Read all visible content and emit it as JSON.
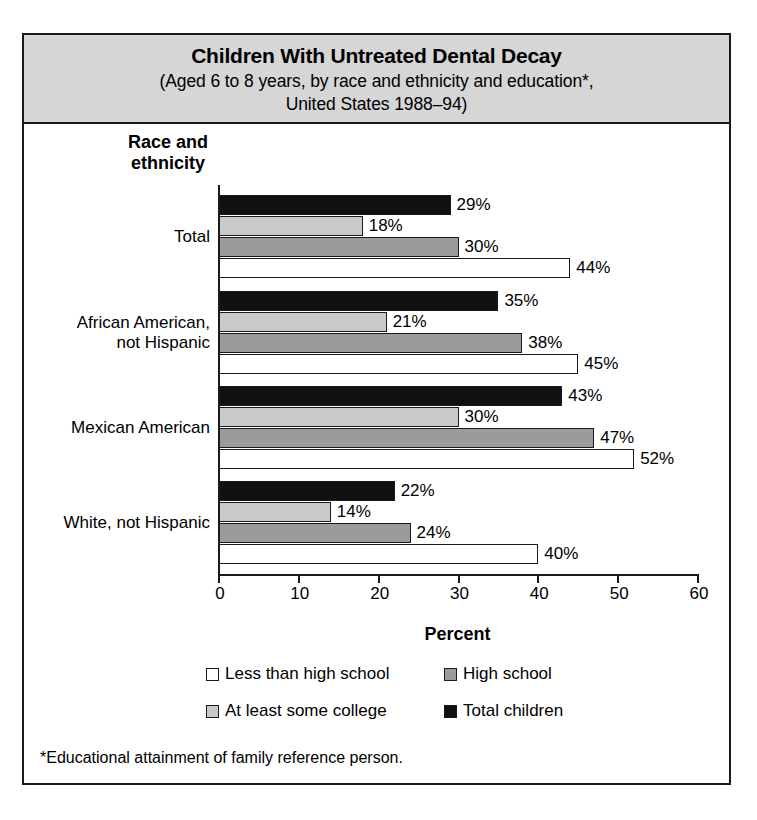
{
  "figure": {
    "title_main": "Children With Untreated Dental Decay",
    "title_sub_line1": "(Aged 6 to 8 years, by race and ethnicity and education*,",
    "title_sub_line2": "United States 1988–94)",
    "footnote": "*Educational attainment of family reference person."
  },
  "axes": {
    "y_title_line1": "Race and",
    "y_title_line2": "ethnicity",
    "x_title": "Percent"
  },
  "legend": {
    "items": [
      {
        "label": "Less than high school",
        "key": "lths",
        "color": "#ffffff"
      },
      {
        "label": "High school",
        "key": "hs",
        "color": "#9b9b9b"
      },
      {
        "label": "At least some college",
        "key": "col",
        "color": "#c9c9c9"
      },
      {
        "label": "Total children",
        "key": "total",
        "color": "#111111"
      }
    ]
  },
  "chart_data": {
    "type": "bar",
    "orientation": "horizontal",
    "title": "Children With Untreated Dental Decay",
    "subtitle": "(Aged 6 to 8 years, by race and ethnicity and education*, United States 1988–94)",
    "xlabel": "Percent",
    "ylabel": "Race and ethnicity",
    "xlim": [
      0,
      60
    ],
    "xticks": [
      0,
      10,
      20,
      30,
      40,
      50,
      60
    ],
    "xtick_labels": [
      "0",
      "10",
      "20",
      "30",
      "40",
      "50",
      "60"
    ],
    "grid": false,
    "legend_position": "bottom",
    "value_label_suffix": "%",
    "categories": [
      "Total",
      "African American, not Hispanic",
      "Mexican American",
      "White, not Hispanic"
    ],
    "category_lines": [
      [
        "Total"
      ],
      [
        "African American,",
        "not Hispanic"
      ],
      [
        "Mexican American"
      ],
      [
        "White, not Hispanic"
      ]
    ],
    "series": [
      {
        "name": "Total children",
        "key": "total",
        "color": "#111111",
        "values": [
          29,
          35,
          43,
          22
        ]
      },
      {
        "name": "At least some college",
        "key": "col",
        "color": "#c9c9c9",
        "values": [
          18,
          21,
          30,
          14
        ]
      },
      {
        "name": "High school",
        "key": "hs",
        "color": "#9b9b9b",
        "values": [
          30,
          38,
          47,
          24
        ]
      },
      {
        "name": "Less than high school",
        "key": "lths",
        "color": "#ffffff",
        "values": [
          44,
          45,
          52,
          40
        ]
      }
    ],
    "value_labels": [
      [
        "29%",
        "18%",
        "30%",
        "44%"
      ],
      [
        "35%",
        "21%",
        "38%",
        "45%"
      ],
      [
        "43%",
        "30%",
        "47%",
        "52%"
      ],
      [
        "22%",
        "14%",
        "24%",
        "40%"
      ]
    ]
  }
}
